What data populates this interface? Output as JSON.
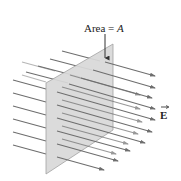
{
  "diagram": {
    "area_label_prefix": "Area = ",
    "area_symbol": "A",
    "field_symbol": "E",
    "colors": {
      "plane_fill": "#d9d9d9",
      "plane_stroke": "#9a9a9a",
      "field_line": "#6e6e6e",
      "label_arrow": "#333333"
    },
    "field_line_rows": 8,
    "field_line_cols": 2
  }
}
